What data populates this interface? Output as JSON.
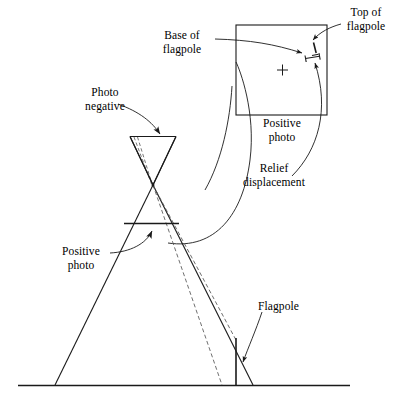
{
  "figure": {
    "type": "technical-line-diagram",
    "ink_color": "#1a1a1a",
    "background_color": "#ffffff"
  },
  "labels": {
    "photo_negative": "Photo\nnegative",
    "positive_photo_left": "Positive\nphoto",
    "base_of_flagpole": "Base of\nflagpole",
    "top_of_flagpole": "Top of\nflagpole",
    "positive_photo_box": "Positive\nphoto",
    "relief_displacement": "Relief\ndisplacement",
    "flagpole": "Flagpole"
  },
  "parts": {
    "photo_box": {
      "name": "positive-photo-frame",
      "x": 236,
      "y": 25,
      "width": 91,
      "height": 90
    },
    "fiducial_mark": {
      "name": "principal-point-cross",
      "x": 282,
      "y": 70,
      "size": 11
    },
    "negative_triangle": {
      "name": "photo-negative-plane",
      "left": 130,
      "right": 176,
      "top": 136,
      "apex_y": 185
    },
    "perspective_center": {
      "name": "exposure-station",
      "x": 153,
      "y": 185
    },
    "positive_photo_line": {
      "name": "positive-photo-plane",
      "x1": 124,
      "x2": 178,
      "y": 223
    },
    "ground_line": {
      "name": "ground-datum",
      "x1": 18,
      "x2": 350,
      "y": 385
    },
    "flagpole_object": {
      "name": "flagpole-object",
      "x": 236,
      "y_top": 338,
      "y_bottom": 385
    }
  }
}
